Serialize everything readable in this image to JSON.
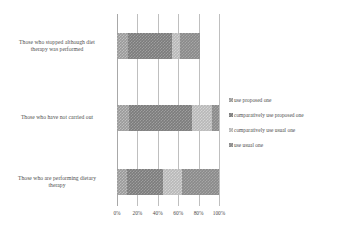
{
  "chart_data": {
    "type": "bar",
    "orientation": "horizontal",
    "stacked": true,
    "stack_mode": "percent",
    "title": "",
    "xlabel": "",
    "ylabel": "",
    "xlim": [
      0,
      100
    ],
    "xticks": [
      "0%",
      "20%",
      "40%",
      "60%",
      "80%",
      "100%"
    ],
    "xtick_values": [
      0,
      20,
      40,
      60,
      80,
      100
    ],
    "grid": true,
    "legend_position": "right",
    "categories": [
      "Those who stopped although diet therapy was performed",
      "Those who have not carried out",
      "Those who are performing dietary therapy"
    ],
    "series": [
      {
        "name": "use proposed one",
        "values": [
          11,
          12,
          10
        ]
      },
      {
        "name": "comparatively use proposed one",
        "values": [
          43,
          62,
          35
        ]
      },
      {
        "name": "comparatively use usual one",
        "values": [
          8,
          19,
          19
        ]
      },
      {
        "name": "use usual one",
        "values": [
          19,
          7,
          36
        ]
      }
    ],
    "series_colors": [
      "#9a9a9a",
      "#7c7c7c",
      "#b8b8b8",
      "#8a8a8a"
    ]
  },
  "axis": {
    "ticks": [
      {
        "label": "0%",
        "value": 0
      },
      {
        "label": "20%",
        "value": 20
      },
      {
        "label": "40%",
        "value": 40
      },
      {
        "label": "60%",
        "value": 60
      },
      {
        "label": "80%",
        "value": 80
      },
      {
        "label": "100%",
        "value": 100
      }
    ]
  },
  "categories": [
    {
      "line1": "Those who stopped although diet",
      "line2": "therapy was performed"
    },
    {
      "line1": "Those who have not carried out",
      "line2": ""
    },
    {
      "line1": "Those who are performing dietary",
      "line2": "therapy"
    }
  ],
  "legend": {
    "items": [
      {
        "label": "use proposed one",
        "color": "#9a9a9a"
      },
      {
        "label": "comparatively use proposed one",
        "color": "#7c7c7c"
      },
      {
        "label": "comparatively use usual one",
        "color": "#b8b8b8"
      },
      {
        "label": "use usual one",
        "color": "#8a8a8a"
      }
    ]
  }
}
